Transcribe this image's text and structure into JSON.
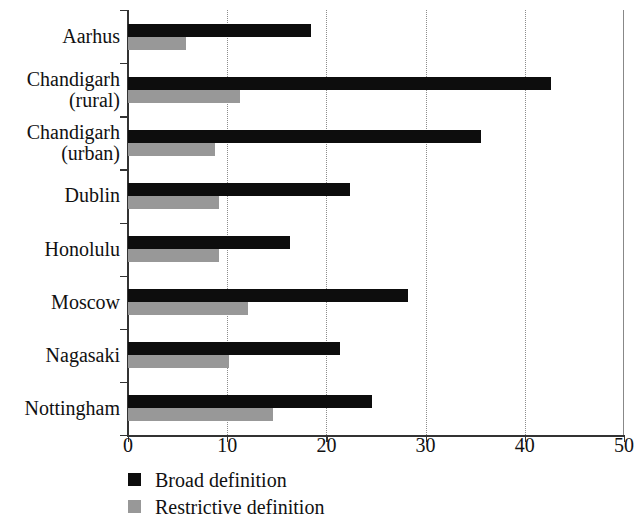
{
  "chart_data": {
    "type": "bar",
    "orientation": "horizontal",
    "title": "",
    "xlabel": "",
    "ylabel": "",
    "xlim": [
      0,
      50
    ],
    "xticks": [
      0,
      10,
      20,
      30,
      40,
      50
    ],
    "xticklabels": [
      "0",
      "10",
      "20",
      "30",
      "40",
      "50"
    ],
    "grid": "vertical-dotted",
    "legend_position": "below-left",
    "categories": [
      "Aarhus",
      "Chandigarh (rural)",
      "Chandigarh (urban)",
      "Dublin",
      "Honolulu",
      "Moscow",
      "Nagasaki",
      "Nottingham"
    ],
    "category_lines": [
      [
        "Aarhus"
      ],
      [
        "Chandigarh",
        "(rural)"
      ],
      [
        "Chandigarh",
        "(urban)"
      ],
      [
        "Dublin"
      ],
      [
        "Honolulu"
      ],
      [
        "Moscow"
      ],
      [
        "Nagasaki"
      ],
      [
        "Nottingham"
      ]
    ],
    "series": [
      {
        "name": "Broad definition",
        "color": "#0d0d0d",
        "values": [
          18.4,
          42.6,
          35.6,
          22.4,
          16.3,
          28.2,
          21.4,
          24.6
        ]
      },
      {
        "name": "Restrictive definition",
        "color": "#989898",
        "values": [
          5.8,
          11.3,
          8.8,
          9.2,
          9.2,
          12.1,
          10.2,
          14.6
        ]
      }
    ]
  },
  "legend": {
    "items": [
      {
        "label": "Broad definition",
        "color": "#0d0d0d"
      },
      {
        "label": "Restrictive definition",
        "color": "#989898"
      }
    ]
  }
}
